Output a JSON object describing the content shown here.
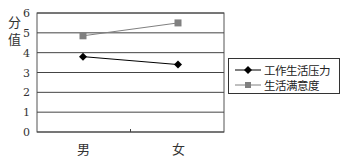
{
  "chart_data": {
    "type": "line",
    "title": "",
    "xlabel": "",
    "ylabel": "分值",
    "ylim": [
      0,
      6
    ],
    "yticks": [
      0,
      1,
      2,
      3,
      4,
      5,
      6
    ],
    "grid": true,
    "legend_position": "right",
    "categories": [
      "男",
      "女"
    ],
    "series": [
      {
        "name": "工作生活压力",
        "marker": "diamond",
        "color": "#000000",
        "values": [
          3.8,
          3.4
        ]
      },
      {
        "name": "生活满意度",
        "marker": "square",
        "color": "#808080",
        "values": [
          4.85,
          5.5
        ]
      }
    ]
  },
  "axis": {
    "ylabel_line1": "分",
    "ylabel_line2": "值",
    "ytick_labels": [
      "0",
      "1",
      "2",
      "3",
      "4",
      "5",
      "6"
    ],
    "xtick_labels": [
      "男",
      "女"
    ]
  },
  "legend": {
    "items": [
      {
        "label": "工作生活压力"
      },
      {
        "label": "生活满意度"
      }
    ]
  }
}
